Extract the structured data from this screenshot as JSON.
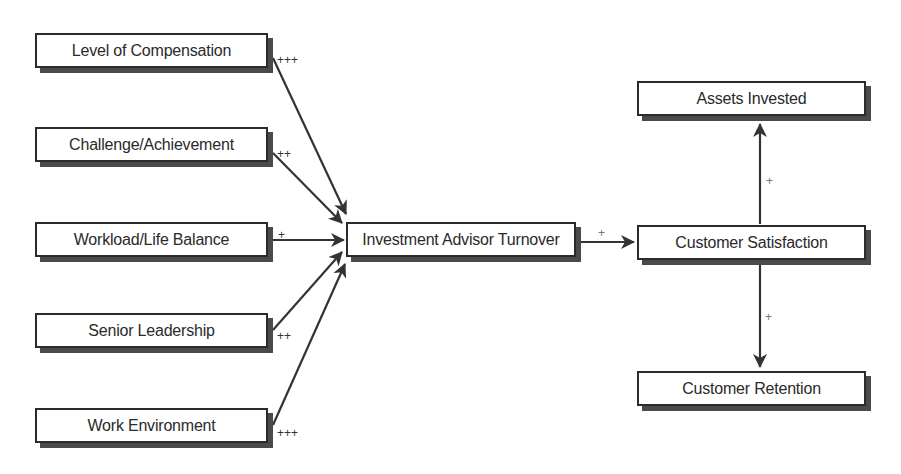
{
  "diagram": {
    "drivers": [
      {
        "label": "Level of Compensation",
        "effect": "+++"
      },
      {
        "label": "Challenge/Achievement",
        "effect": "++"
      },
      {
        "label": "Workload/Life Balance",
        "effect": "+"
      },
      {
        "label": "Senior Leadership",
        "effect": "++"
      },
      {
        "label": "Work Environment",
        "effect": "+++"
      }
    ],
    "center": {
      "label": "Investment Advisor Turnover"
    },
    "center_to_outcome_effect": "+",
    "outcome": {
      "label": "Customer Satisfaction"
    },
    "results": [
      {
        "label": "Assets Invested",
        "effect": "+"
      },
      {
        "label": "Customer Retention",
        "effect": "+"
      }
    ]
  }
}
